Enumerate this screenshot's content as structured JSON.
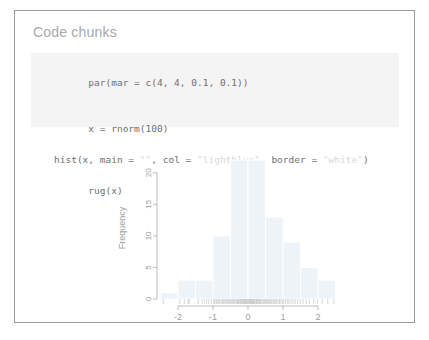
{
  "slide": {
    "title": "Code chunks",
    "border_color": "#9a9a9a",
    "background": "#ffffff"
  },
  "code_block": {
    "background": "#f4f4f4",
    "text_color": "#6f6f6f",
    "string_color": "#d9d9d9",
    "lines": [
      {
        "id": "line-1",
        "segments": [
          {
            "text": "par(mar = c(4, 4, 0.1, 0.1))",
            "kind": "code"
          }
        ]
      },
      {
        "id": "line-2",
        "segments": [
          {
            "text": "x = rnorm(100)",
            "kind": "code"
          }
        ]
      },
      {
        "id": "line-3",
        "segments": [
          {
            "text": "hist(x, main = ",
            "kind": "code"
          },
          {
            "text": "\"\"",
            "kind": "string"
          },
          {
            "text": ", col = ",
            "kind": "code"
          },
          {
            "text": "\"lightblue\"",
            "kind": "string"
          },
          {
            "text": ", border = ",
            "kind": "code"
          },
          {
            "text": "\"white\"",
            "kind": "string"
          },
          {
            "text": ")",
            "kind": "code"
          }
        ]
      },
      {
        "id": "line-4",
        "segments": [
          {
            "text": "rug(x)",
            "kind": "code"
          }
        ]
      }
    ],
    "line_1_text": "par(mar = c(4, 4, 0.1, 0.1))",
    "line_2_text": "x = rnorm(100)",
    "line_3_part_1": "hist(x, main = ",
    "line_3_str_1": "\"\"",
    "line_3_part_2": ", col = ",
    "line_3_str_2": "\"lightblue\"",
    "line_3_part_3": ", border = ",
    "line_3_str_3": "\"white\"",
    "line_3_part_4": ")",
    "line_4_text": "rug(x)"
  },
  "chart_data": {
    "type": "bar",
    "title": "",
    "xlabel": "",
    "ylabel": "Frequency",
    "xlim": [
      -2.6,
      2.6
    ],
    "ylim": [
      0,
      22.5
    ],
    "xticks": [
      -2,
      -1,
      0,
      1,
      2
    ],
    "xtick_labels": [
      "-2",
      "-1",
      "0",
      "1",
      "2"
    ],
    "yticks": [
      0,
      5,
      10,
      15,
      20
    ],
    "ytick_labels": [
      "0",
      "5",
      "10",
      "15",
      "20"
    ],
    "grid": false,
    "legend": null,
    "bar_color": "#eef3f7",
    "bar_border_color": "#ffffff",
    "axis_color": "#bdbdbd",
    "bin_width": 0.5,
    "bin_edges": [
      -2.5,
      -2.0,
      -1.5,
      -1.0,
      -0.5,
      0.0,
      0.5,
      1.0,
      1.5,
      2.0,
      2.5
    ],
    "categories": [
      "-2.5 to -2.0",
      "-2.0 to -1.5",
      "-1.5 to -1.0",
      "-1.0 to -0.5",
      "-0.5 to 0.0",
      "0.0 to 0.5",
      "0.5 to 1.0",
      "1.0 to 1.5",
      "1.5 to 2.0",
      "2.0 to 2.5"
    ],
    "values": [
      1,
      3,
      3,
      10,
      22,
      22,
      13,
      9,
      5,
      3
    ],
    "rug": {
      "label": "rug(x)",
      "n": 100,
      "color": "#9a9a9a",
      "values": [
        -2.42,
        -1.95,
        -1.82,
        -1.71,
        -1.68,
        -1.42,
        -1.31,
        -1.24,
        -1.18,
        -1.12,
        -1.05,
        -0.98,
        -0.95,
        -0.91,
        -0.88,
        -0.84,
        -0.81,
        -0.77,
        -0.74,
        -0.71,
        -0.68,
        -0.64,
        -0.61,
        -0.58,
        -0.55,
        -0.52,
        -0.49,
        -0.46,
        -0.43,
        -0.41,
        -0.38,
        -0.35,
        -0.32,
        -0.3,
        -0.27,
        -0.25,
        -0.22,
        -0.2,
        -0.18,
        -0.15,
        -0.13,
        -0.11,
        -0.09,
        -0.07,
        -0.05,
        -0.03,
        -0.01,
        0.01,
        0.03,
        0.05,
        0.07,
        0.09,
        0.11,
        0.13,
        0.15,
        0.17,
        0.19,
        0.21,
        0.24,
        0.26,
        0.28,
        0.31,
        0.33,
        0.36,
        0.38,
        0.41,
        0.44,
        0.47,
        0.5,
        0.53,
        0.56,
        0.59,
        0.62,
        0.65,
        0.68,
        0.72,
        0.75,
        0.79,
        0.82,
        0.86,
        0.9,
        0.94,
        0.98,
        1.02,
        1.07,
        1.12,
        1.17,
        1.23,
        1.29,
        1.35,
        1.42,
        1.49,
        1.57,
        1.66,
        1.76,
        1.88,
        1.99,
        2.12,
        2.28,
        2.45
      ]
    }
  }
}
